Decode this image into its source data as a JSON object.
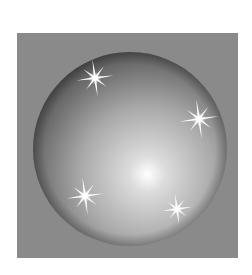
{
  "image": {
    "subject": "glossy sphere with sparkles",
    "width": 252,
    "height": 275,
    "background_color": "#ffffff",
    "panel": {
      "x": 17,
      "y": 33,
      "width": 221,
      "height": 225,
      "color": "#8a8a8a"
    },
    "sphere": {
      "cx": 130,
      "cy": 149,
      "r": 97,
      "highlight": {
        "cx": 148,
        "cy": 174
      },
      "colors": {
        "highlight": "#ffffff",
        "mid": "#b4b4b4",
        "edge": "#3a3a3a"
      }
    },
    "sparkles": [
      {
        "cx": 95,
        "cy": 78,
        "size": 30
      },
      {
        "cx": 199,
        "cy": 119,
        "size": 32
      },
      {
        "cx": 85,
        "cy": 196,
        "size": 30
      },
      {
        "cx": 177,
        "cy": 209,
        "size": 24
      }
    ]
  }
}
